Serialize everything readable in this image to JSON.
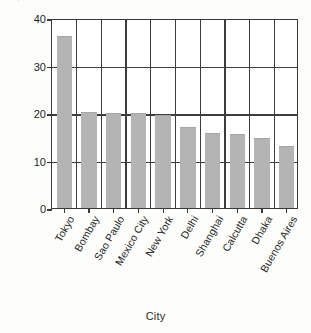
{
  "chart_data": {
    "type": "bar",
    "title": "",
    "xlabel": "City",
    "ylabel": "2010 Population in Millions",
    "categories": [
      "Tokyo",
      "Bombay",
      "Sao Paulo",
      "Mexico City",
      "New York",
      "Delhi",
      "Shanghai",
      "Calcutta",
      "Dhaka",
      "Buenos Aires"
    ],
    "values": [
      36.0,
      20.0,
      19.8,
      19.7,
      19.4,
      16.8,
      15.6,
      15.4,
      14.6,
      12.8
    ],
    "ylim": [
      0,
      40
    ],
    "yticks": [
      0,
      10,
      20,
      30,
      40
    ],
    "ytick_labels": [
      "0",
      "10",
      "20",
      "30",
      "40"
    ],
    "grid": "both",
    "legend": "none",
    "bar_color": "#b4b4b4",
    "axis_color": "#3a3a3a",
    "background": "#ffffff"
  },
  "axes": {
    "y_title": "2010 Population in Millions",
    "x_title": "City"
  }
}
